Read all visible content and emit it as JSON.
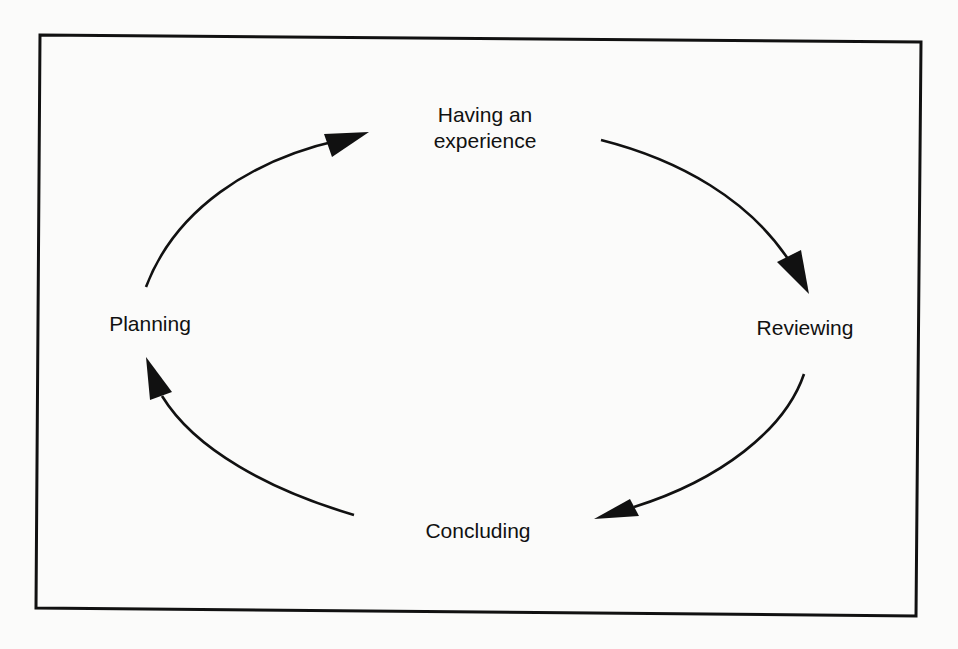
{
  "diagram": {
    "type": "cycle",
    "title": "",
    "nodes": [
      {
        "id": "having",
        "label_line1": "Having an",
        "label_line2": "experience"
      },
      {
        "id": "reviewing",
        "label": "Reviewing"
      },
      {
        "id": "concluding",
        "label": "Concluding"
      },
      {
        "id": "planning",
        "label": "Planning"
      }
    ],
    "edges": [
      {
        "from": "Having an experience",
        "to": "Reviewing",
        "direction": "clockwise"
      },
      {
        "from": "Reviewing",
        "to": "Concluding",
        "direction": "clockwise"
      },
      {
        "from": "Concluding",
        "to": "Planning",
        "direction": "clockwise"
      },
      {
        "from": "Planning",
        "to": "Having an experience",
        "direction": "clockwise"
      }
    ],
    "colors": {
      "stroke": "#111111",
      "background": "#fbfbfa",
      "text": "#111111"
    }
  }
}
